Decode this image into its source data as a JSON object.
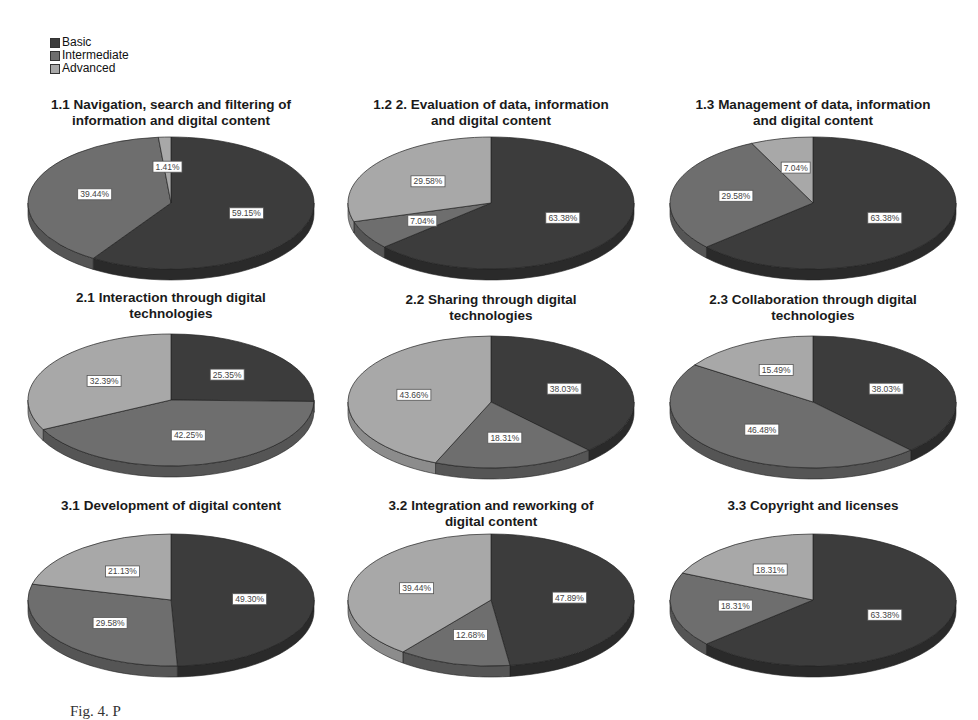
{
  "legend": {
    "items": [
      {
        "label": "Basic",
        "color": "#3c3c3c"
      },
      {
        "label": "Intermediate",
        "color": "#6e6e6e"
      },
      {
        "label": "Advanced",
        "color": "#a8a8a8"
      }
    ]
  },
  "caption": "Fig. 4. P",
  "charts": [
    {
      "title_lines": [
        "1.1 Navigation, search and filtering of",
        "information and digital content"
      ],
      "labels": [
        "59.15%",
        "39.44%",
        "1.41%"
      ]
    },
    {
      "title_lines": [
        "1.2 2. Evaluation of data, information",
        "and digital content"
      ],
      "labels": [
        "63.38%",
        "7.04%",
        "29.58%"
      ]
    },
    {
      "title_lines": [
        "1.3 Management of data, information",
        "and digital content"
      ],
      "labels": [
        "63.38%",
        "29.58%",
        "7.04%"
      ]
    },
    {
      "title_lines": [
        "2.1 Interaction through digital",
        "technologies"
      ],
      "labels": [
        "25.35%",
        "42.25%",
        "32.39%"
      ]
    },
    {
      "title_lines": [
        "2.2 Sharing through digital",
        "technologies"
      ],
      "labels": [
        "38.03%",
        "18.31%",
        "43.66%"
      ]
    },
    {
      "title_lines": [
        "2.3 Collaboration through digital",
        "technologies"
      ],
      "labels": [
        "38.03%",
        "46.48%",
        "15.49%"
      ]
    },
    {
      "title_lines": [
        "3.1 Development of digital content",
        ""
      ],
      "labels": [
        "49.30%",
        "29.58%",
        "21.13%"
      ]
    },
    {
      "title_lines": [
        "3.2 Integration and reworking of",
        "digital content"
      ],
      "labels": [
        "47.89%",
        "12.68%",
        "39.44%"
      ]
    },
    {
      "title_lines": [
        "3.3 Copyright and licenses",
        ""
      ],
      "labels": [
        "63.38%",
        "18.31%",
        "18.31%"
      ]
    }
  ],
  "chart_data": [
    {
      "type": "pie",
      "title": "1.1 Navigation, search and filtering of information and digital content",
      "categories": [
        "Basic",
        "Intermediate",
        "Advanced"
      ],
      "values": [
        59.15,
        39.44,
        1.41
      ]
    },
    {
      "type": "pie",
      "title": "1.2 2. Evaluation of data, information and digital content",
      "categories": [
        "Basic",
        "Intermediate",
        "Advanced"
      ],
      "values": [
        63.38,
        7.04,
        29.58
      ]
    },
    {
      "type": "pie",
      "title": "1.3 Management of data, information and digital content",
      "categories": [
        "Basic",
        "Intermediate",
        "Advanced"
      ],
      "values": [
        63.38,
        29.58,
        7.04
      ]
    },
    {
      "type": "pie",
      "title": "2.1 Interaction through digital technologies",
      "categories": [
        "Basic",
        "Intermediate",
        "Advanced"
      ],
      "values": [
        25.35,
        42.25,
        32.39
      ]
    },
    {
      "type": "pie",
      "title": "2.2 Sharing through digital technologies",
      "categories": [
        "Basic",
        "Intermediate",
        "Advanced"
      ],
      "values": [
        38.03,
        18.31,
        43.66
      ]
    },
    {
      "type": "pie",
      "title": "2.3 Collaboration through digital technologies",
      "categories": [
        "Basic",
        "Intermediate",
        "Advanced"
      ],
      "values": [
        38.03,
        46.48,
        15.49
      ]
    },
    {
      "type": "pie",
      "title": "3.1 Development of digital content",
      "categories": [
        "Basic",
        "Intermediate",
        "Advanced"
      ],
      "values": [
        49.3,
        29.58,
        21.13
      ]
    },
    {
      "type": "pie",
      "title": "3.2 Integration and reworking of digital content",
      "categories": [
        "Basic",
        "Intermediate",
        "Advanced"
      ],
      "values": [
        47.89,
        12.68,
        39.44
      ]
    },
    {
      "type": "pie",
      "title": "3.3 Copyright and licenses",
      "categories": [
        "Basic",
        "Intermediate",
        "Advanced"
      ],
      "values": [
        63.38,
        18.31,
        18.31
      ]
    }
  ]
}
